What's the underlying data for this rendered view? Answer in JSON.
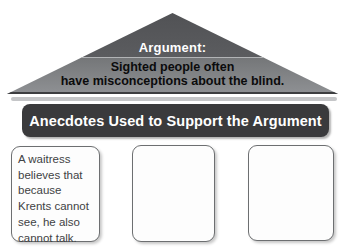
{
  "pyramid": {
    "title": "Argument:",
    "statement": "Sighted people often\nhave misconceptions about the blind."
  },
  "banner": {
    "label": "Anecdotes Used to Support the Argument"
  },
  "anecdote_boxes": [
    {
      "text": "A waitress\nbelieves that\nbecause\nKrents cannot\nsee, he also\ncannot talk."
    },
    {
      "text": ""
    },
    {
      "text": ""
    }
  ],
  "colors": {
    "pyramid_top": "#515255",
    "pyramid_bottom": "#8f9194",
    "pyramid_base_edge": "#3d3e40",
    "divider_line": "#b2b4b6",
    "banner_background": "#3a3a3c",
    "banner_text": "#ffffff",
    "box_border": "#6d6f71",
    "box_fill": "#fdfdfd",
    "box_text": "#414244",
    "statement_text": "#0b0b0c",
    "shadow_strip": "#c5c6c8"
  }
}
